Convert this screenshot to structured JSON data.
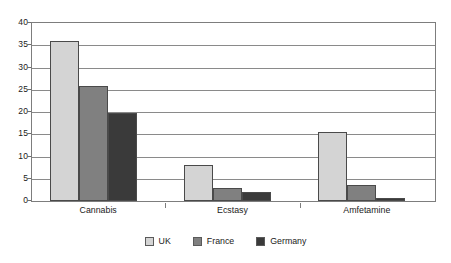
{
  "chart_data": {
    "type": "bar",
    "title": "",
    "subtitle": "",
    "xlabel": "",
    "ylabel": "",
    "categories": [
      "Cannabis",
      "Ecstasy",
      "Amfetamine"
    ],
    "series": [
      {
        "name": "UK",
        "color": "#d4d4d4",
        "values": [
          36.0,
          8.0,
          15.6
        ]
      },
      {
        "name": "France",
        "color": "#808080",
        "values": [
          25.8,
          3.0,
          3.6
        ]
      },
      {
        "name": "Germany",
        "color": "#3a3a3a",
        "values": [
          19.8,
          2.0,
          0.7
        ]
      }
    ],
    "ylim": [
      0,
      40
    ],
    "yticks": [
      0,
      5,
      10,
      15,
      20,
      25,
      30,
      35,
      40
    ],
    "ytick_labels": [
      "0",
      "5",
      "10",
      "15",
      "20",
      "25",
      "30",
      "35",
      "40"
    ],
    "grid": true,
    "grid_axis": "y",
    "legend_position": "bottom",
    "plot_background": "#ffffff",
    "frame_color": "#7d7d7d",
    "gridline_color": "#8a8a8a"
  }
}
